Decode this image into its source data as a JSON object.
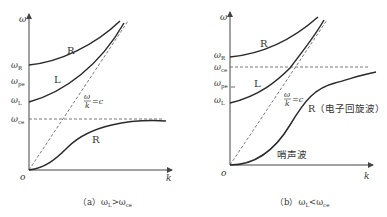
{
  "panel_a": {
    "y_axis": "ω",
    "x_axis": "k",
    "origin": "o",
    "ticks": {
      "omega_R": "ω",
      "omega_R_sub": "R",
      "omega_pe": "ω",
      "omega_pe_sub": "pe",
      "omega_L": "ω",
      "omega_L_sub": "L",
      "omega_ce": "ω",
      "omega_ce_sub": "ce"
    },
    "curves": {
      "upper_R": "R",
      "L": "L",
      "lower_R": "R"
    },
    "light_line_num": "ω",
    "light_line_den": "k",
    "light_line_eq": "=c",
    "caption": "（a）ω",
    "caption_sub1": "L",
    "caption_op": ">ω",
    "caption_sub2": "ce"
  },
  "panel_b": {
    "y_axis": "ω",
    "x_axis": "k",
    "origin": "o",
    "ticks": {
      "omega_R": "ω",
      "omega_R_sub": "R",
      "omega_ce": "ω",
      "omega_ce_sub": "ce",
      "omega_pe": "ω",
      "omega_pe_sub": "pe",
      "omega_L": "ω",
      "omega_L_sub": "L"
    },
    "curves": {
      "upper_R": "R",
      "L": "L",
      "lower_R": "R（电子回旋波）",
      "whistler": "哨声波"
    },
    "light_line_num": "ω",
    "light_line_den": "k",
    "light_line_eq": "=c",
    "caption": "（b）ω",
    "caption_sub1": "L",
    "caption_op": "<ω",
    "caption_sub2": "ce"
  },
  "colors": {
    "curve": "#2a2a2a",
    "axis": "#444444",
    "dashed": "#555555"
  }
}
